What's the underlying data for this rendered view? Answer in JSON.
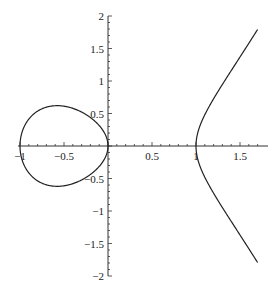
{
  "chart_data": {
    "type": "line",
    "title": "",
    "xlabel": "",
    "ylabel": "",
    "equation": "y^2 = x^3 - x",
    "xlim": [
      -1,
      1.7
    ],
    "ylim": [
      -2,
      2
    ],
    "grid": false,
    "x_ticks": [
      {
        "value": -1,
        "label": "−1"
      },
      {
        "value": -0.5,
        "label": "−0.5"
      },
      {
        "value": 0.5,
        "label": "0.5"
      },
      {
        "value": 1,
        "label": "1"
      },
      {
        "value": 1.5,
        "label": "1.5"
      }
    ],
    "y_ticks": [
      {
        "value": 2,
        "label": "2"
      },
      {
        "value": 1.5,
        "label": "1.5"
      },
      {
        "value": 1,
        "label": "1"
      },
      {
        "value": 0.5,
        "label": "0.5"
      },
      {
        "value": -0.5,
        "label": "−0.5"
      },
      {
        "value": -1,
        "label": "−1"
      },
      {
        "value": -1.5,
        "label": "−1.5"
      },
      {
        "value": -2,
        "label": "−2"
      }
    ],
    "series": [
      {
        "name": "oval",
        "x_range": [
          -1,
          0
        ],
        "color": "#222222"
      },
      {
        "name": "unbounded branch",
        "x_range": [
          1,
          1.7
        ],
        "color": "#222222"
      }
    ],
    "sample_points": [
      {
        "x": -1,
        "y": 0
      },
      {
        "x": -0.577,
        "y": 0.62
      },
      {
        "x": -0.577,
        "y": -0.62
      },
      {
        "x": 0,
        "y": 0
      },
      {
        "x": 1,
        "y": 0
      },
      {
        "x": 1.5,
        "y": 1.37
      },
      {
        "x": 1.5,
        "y": -1.37
      },
      {
        "x": 1.7,
        "y": 1.79
      },
      {
        "x": 1.7,
        "y": -1.79
      }
    ]
  }
}
